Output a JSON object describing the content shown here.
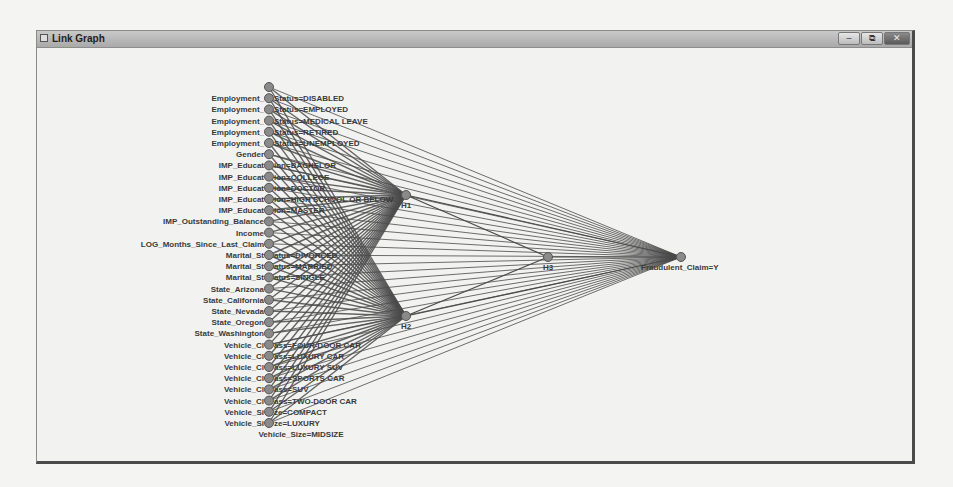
{
  "window": {
    "title": "Link Graph",
    "buttons": {
      "minimize": "–",
      "restore": "⧉",
      "close": "✕"
    }
  },
  "graph": {
    "edge_color": "#4a4a4a",
    "node_color": "#8a8a8a",
    "input_x": 268,
    "input_y_start": 86,
    "input_spacing": 11.2,
    "input_nodes": [
      "",
      "Employment_Status=DISABLED",
      "Employment_Status=EMPLOYED",
      "Employment_Status=MEDICAL LEAVE",
      "Employment_Status=RETIRED",
      "Employment_Status=UNEMPLOYED",
      "Gender",
      "IMP_Education=BACHELOR",
      "IMP_Education=COLLEGE",
      "IMP_Education=DOCTOR",
      "IMP_Education=HIGH SCHOOL OR BELOW",
      "IMP_Education=MASTER",
      "IMP_Outstanding_Balance",
      "Income",
      "LOG_Months_Since_Last_Claim",
      "Marital_Status=DIVORCED",
      "Marital_Status=MARRIED",
      "Marital_Status=SINGLE",
      "State_Arizona",
      "State_California",
      "State_Nevada",
      "State_Oregon",
      "State_Washington",
      "Vehicle_Class=FOUR-DOOR CAR",
      "Vehicle_Class=LUXURY CAR",
      "Vehicle_Class=LUXURY SUV",
      "Vehicle_Class=SPORTS CAR",
      "Vehicle_Class=SUV",
      "Vehicle_Class=TWO-DOOR CAR",
      "Vehicle_Size=COMPACT",
      "Vehicle_Size=LUXURY"
    ],
    "extra_label": "Vehicle_Size=MIDSIZE",
    "hidden_nodes": [
      {
        "label": "H1",
        "x": 405,
        "y": 194
      },
      {
        "label": "H2",
        "x": 405,
        "y": 315
      },
      {
        "label": "H3",
        "x": 547,
        "y": 256
      }
    ],
    "output_node": {
      "label": "Fraudulent_Claim=Y",
      "x": 680,
      "y": 256
    }
  }
}
